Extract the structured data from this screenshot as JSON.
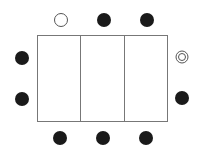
{
  "diagram": {
    "table": {
      "x": 37,
      "y": 35,
      "width": 130,
      "height": 86,
      "stroke": "#777777",
      "dividers_x": [
        80,
        124
      ]
    },
    "seats": [
      {
        "id": "top-1",
        "type": "open",
        "cx": 61,
        "cy": 20
      },
      {
        "id": "top-2",
        "type": "filled",
        "cx": 104,
        "cy": 20
      },
      {
        "id": "top-3",
        "type": "filled",
        "cx": 147,
        "cy": 20
      },
      {
        "id": "left-1",
        "type": "filled",
        "cx": 22,
        "cy": 58
      },
      {
        "id": "left-2",
        "type": "filled",
        "cx": 22,
        "cy": 99
      },
      {
        "id": "right-1",
        "type": "double",
        "cx": 182,
        "cy": 57
      },
      {
        "id": "right-2",
        "type": "filled",
        "cx": 182,
        "cy": 98
      },
      {
        "id": "bottom-1",
        "type": "filled",
        "cx": 60,
        "cy": 138
      },
      {
        "id": "bottom-2",
        "type": "filled",
        "cx": 103,
        "cy": 138
      },
      {
        "id": "bottom-3",
        "type": "filled",
        "cx": 146,
        "cy": 138
      }
    ],
    "colors": {
      "filled": "#1a1a1a",
      "outline": "#555555",
      "background": "#ffffff"
    }
  }
}
